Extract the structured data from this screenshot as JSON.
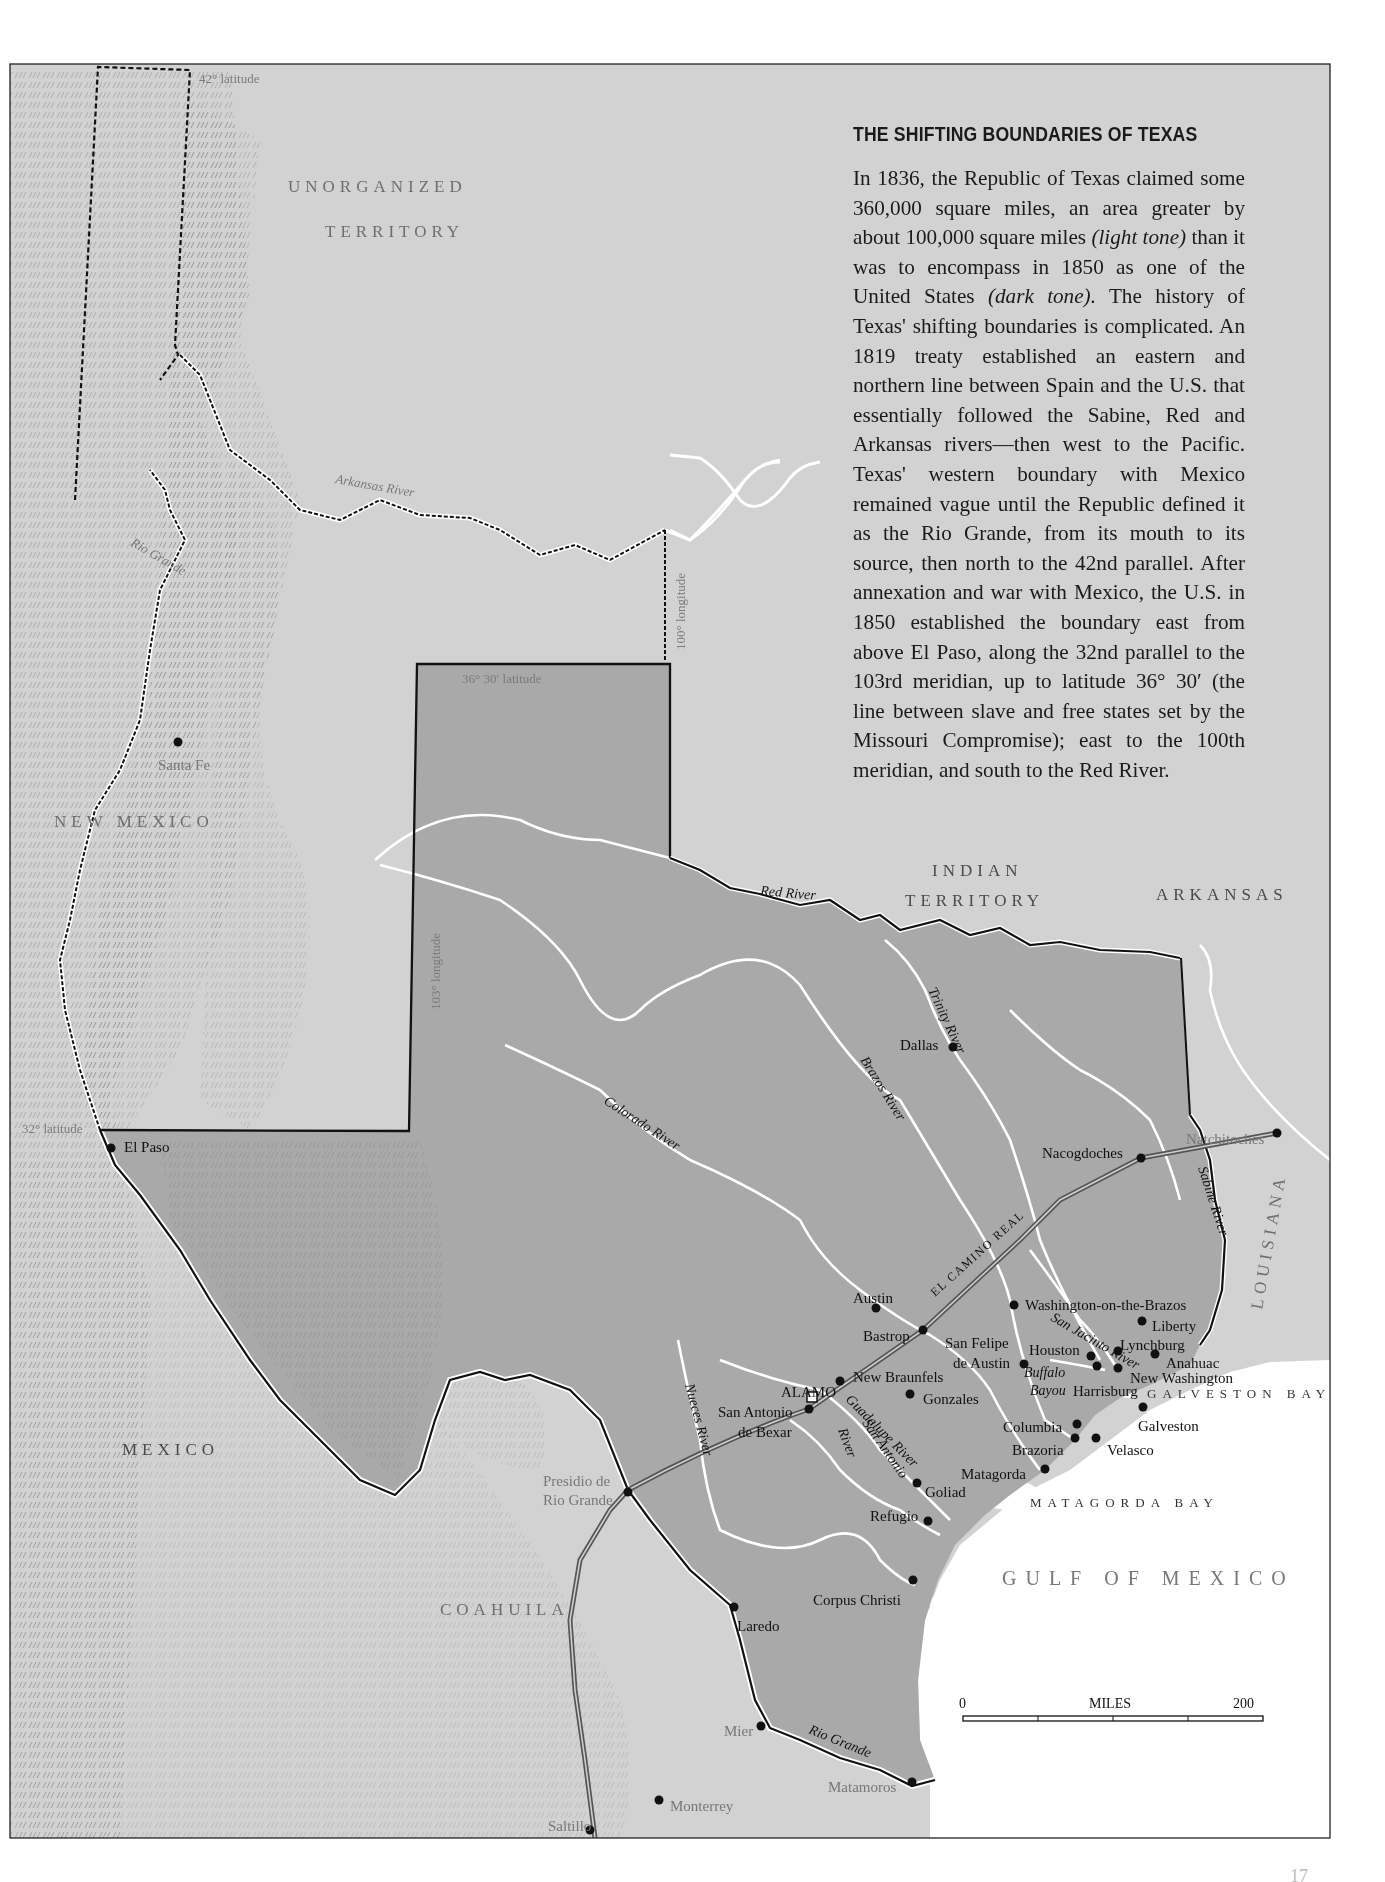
{
  "panel": {
    "title": "THE SHIFTING BOUNDARIES OF TEXAS",
    "body_segments": [
      {
        "text": "In 1836, the Republic of Texas claimed some 360,000 square miles, an area greater by about 100,000 square miles ",
        "italic": false
      },
      {
        "text": "(light tone)",
        "italic": true
      },
      {
        "text": " than it was to encompass in 1850 as one of the United States ",
        "italic": false
      },
      {
        "text": "(dark tone).",
        "italic": true
      },
      {
        "text": " The history of Texas' shifting boundaries is complicated. An 1819 treaty established an eastern and northern line between Spain and the U.S. that essentially followed the Sabine, Red and Arkansas rivers—then west to the Pacific. Texas' western boundary with Mexico remained vague until the Republic defined it as the Rio Grande, from its mouth to its source, then north to the 42nd parallel. After annexation and war with Mexico, the U.S. in 1850 established the boundary east from above El Paso, along the 32nd parallel to the 103rd meridian, up to latitude 36° 30′ (the line between slave and free states set by the Missouri Compromise); east to the 100th meridian, and south to the Red River.",
        "italic": false
      }
    ]
  },
  "colors": {
    "paper": "#ffffff",
    "light_tone": "#d2d2d2",
    "dark_tone": "#a9a9a9",
    "water": "#ffffff",
    "boundary": "#111111",
    "river": "#ffffff",
    "relief": "#6a6a6a"
  },
  "regions": [
    {
      "label": "UNORGANIZED",
      "x": 288,
      "y": 192,
      "style": "region-label"
    },
    {
      "label": "TERRITORY",
      "x": 325,
      "y": 237,
      "style": "region-label"
    },
    {
      "label": "NEW MEXICO",
      "x": 54,
      "y": 827,
      "style": "region-label"
    },
    {
      "label": "INDIAN",
      "x": 932,
      "y": 876,
      "style": "region-label-dark"
    },
    {
      "label": "TERRITORY",
      "x": 905,
      "y": 906,
      "style": "region-label-dark"
    },
    {
      "label": "ARKANSAS",
      "x": 1156,
      "y": 900,
      "style": "region-label-dark"
    },
    {
      "label": "MEXICO",
      "x": 122,
      "y": 1455,
      "style": "region-label-dark"
    },
    {
      "label": "COAHUILA",
      "x": 440,
      "y": 1615,
      "style": "region-label"
    }
  ],
  "louisiana": {
    "label": "LOUISIANA",
    "x": 1262,
    "y": 1310,
    "rotate": -80
  },
  "water_bodies": [
    {
      "label": "GALVESTON BAY",
      "x": 1147,
      "y": 1398,
      "style": "water-label"
    },
    {
      "label": "MATAGORDA BAY",
      "x": 1030,
      "y": 1507,
      "style": "water-label"
    },
    {
      "label": "GULF OF MEXICO",
      "x": 1002,
      "y": 1585,
      "style": "gulf-label"
    }
  ],
  "boundary_labels": [
    {
      "label": "42° latitude",
      "x": 199,
      "y": 83,
      "rotate": 0
    },
    {
      "label": "36° 30′ latitude",
      "x": 462,
      "y": 683,
      "rotate": 0
    },
    {
      "label": "32° latitude",
      "x": 22,
      "y": 1133,
      "rotate": 0
    },
    {
      "label": "100° longitude",
      "x": 685,
      "y": 650,
      "rotate": -90
    },
    {
      "label": "103° longitude",
      "x": 440,
      "y": 1010,
      "rotate": -90
    }
  ],
  "rivers": [
    {
      "label": "Arkansas River",
      "x": 335,
      "y": 483,
      "rotate": 10,
      "style": "river-label-light"
    },
    {
      "label": "Rio Grande",
      "x": 130,
      "y": 545,
      "rotate": 30,
      "style": "river-label-light"
    },
    {
      "label": "Red River",
      "x": 760,
      "y": 895,
      "rotate": 5,
      "style": "river-label"
    },
    {
      "label": "Trinity River",
      "x": 928,
      "y": 990,
      "rotate": 65,
      "style": "river-label"
    },
    {
      "label": "Brazos River",
      "x": 860,
      "y": 1060,
      "rotate": 58,
      "style": "river-label"
    },
    {
      "label": "Colorado River",
      "x": 603,
      "y": 1103,
      "rotate": 33,
      "style": "river-label"
    },
    {
      "label": "Sabine River",
      "x": 1198,
      "y": 1168,
      "rotate": 72,
      "style": "river-label"
    },
    {
      "label": "San Jacinto River",
      "x": 1050,
      "y": 1320,
      "rotate": 30,
      "style": "river-label"
    },
    {
      "label": "Buffalo",
      "x": 1024,
      "y": 1377,
      "rotate": 0,
      "style": "river-label"
    },
    {
      "label": "Bayou",
      "x": 1030,
      "y": 1395,
      "rotate": 0,
      "style": "river-label"
    },
    {
      "label": "Guadalupe River",
      "x": 845,
      "y": 1400,
      "rotate": 45,
      "style": "river-label"
    },
    {
      "label": "San Antonio",
      "x": 862,
      "y": 1423,
      "rotate": 55,
      "style": "river-label"
    },
    {
      "label": "River",
      "x": 838,
      "y": 1430,
      "rotate": 70,
      "style": "river-label"
    },
    {
      "label": "Nueces River",
      "x": 685,
      "y": 1385,
      "rotate": 75,
      "style": "river-label"
    },
    {
      "label": "Rio Grande",
      "x": 808,
      "y": 1733,
      "rotate": 22,
      "style": "river-label"
    }
  ],
  "places": [
    {
      "name": "Santa Fe",
      "dot_x": 178,
      "dot_y": 742,
      "label_x": 158,
      "label_y": 765,
      "style": "city-label-light"
    },
    {
      "name": "El Paso",
      "dot_x": 111,
      "dot_y": 1148,
      "label_x": 124,
      "label_y": 1147,
      "style": "city-label"
    },
    {
      "name": "Dallas",
      "dot_x": 953,
      "dot_y": 1047,
      "label_x": 900,
      "label_y": 1045,
      "style": "city-label"
    },
    {
      "name": "Nacogdoches",
      "dot_x": 1141,
      "dot_y": 1158,
      "label_x": 1042,
      "label_y": 1153,
      "style": "city-label"
    },
    {
      "name": "Natchitoches",
      "dot_x": 1277,
      "dot_y": 1133,
      "label_x": 1186,
      "label_y": 1139,
      "style": "city-label-light"
    },
    {
      "name": "Austin",
      "dot_x": 876,
      "dot_y": 1308,
      "label_x": 853,
      "label_y": 1298,
      "style": "city-label"
    },
    {
      "name": "Bastrop",
      "dot_x": 923,
      "dot_y": 1330,
      "label_x": 863,
      "label_y": 1336,
      "style": "city-label"
    },
    {
      "name": "Washington-on-the-Brazos",
      "dot_x": 1014,
      "dot_y": 1305,
      "label_x": 1025,
      "label_y": 1305,
      "style": "city-label"
    },
    {
      "name": "Liberty",
      "dot_x": 1142,
      "dot_y": 1321,
      "label_x": 1152,
      "label_y": 1326,
      "style": "city-label"
    },
    {
      "name": "San Felipe",
      "dot_x": null,
      "dot_y": null,
      "label_x": 945,
      "label_y": 1343,
      "style": "city-label"
    },
    {
      "name": "de Austin",
      "dot_x": 1024,
      "dot_y": 1364,
      "label_x": 953,
      "label_y": 1363,
      "style": "city-label"
    },
    {
      "name": "Houston",
      "dot_x": 1091,
      "dot_y": 1356,
      "label_x": 1029,
      "label_y": 1350,
      "style": "city-label"
    },
    {
      "name": "Lynchburg",
      "dot_x": 1118,
      "dot_y": 1351,
      "label_x": 1120,
      "label_y": 1345,
      "style": "city-label"
    },
    {
      "name": "Anahuac",
      "dot_x": 1155,
      "dot_y": 1354,
      "label_x": 1166,
      "label_y": 1363,
      "style": "city-label"
    },
    {
      "name": "New Washington",
      "dot_x": 1118,
      "dot_y": 1368,
      "label_x": 1130,
      "label_y": 1378,
      "style": "city-label"
    },
    {
      "name": "Harrisburg",
      "dot_x": 1097,
      "dot_y": 1366,
      "label_x": 1073,
      "label_y": 1391,
      "style": "city-label"
    },
    {
      "name": "Galveston",
      "dot_x": 1143,
      "dot_y": 1407,
      "label_x": 1138,
      "label_y": 1426,
      "style": "city-label"
    },
    {
      "name": "Columbia",
      "dot_x": 1077,
      "dot_y": 1424,
      "label_x": 1003,
      "label_y": 1427,
      "style": "city-label"
    },
    {
      "name": "Brazoria",
      "dot_x": 1075,
      "dot_y": 1438,
      "label_x": 1012,
      "label_y": 1450,
      "style": "city-label"
    },
    {
      "name": "Velasco",
      "dot_x": 1096,
      "dot_y": 1438,
      "label_x": 1107,
      "label_y": 1450,
      "style": "city-label"
    },
    {
      "name": "Matagorda",
      "dot_x": 1045,
      "dot_y": 1469,
      "label_x": 961,
      "label_y": 1474,
      "style": "city-label"
    },
    {
      "name": "New Braunfels",
      "dot_x": 840,
      "dot_y": 1381,
      "label_x": 853,
      "label_y": 1377,
      "style": "city-label"
    },
    {
      "name": "ALAMO",
      "dot_x": null,
      "dot_y": null,
      "label_x": 781,
      "label_y": 1392,
      "style": "city-label"
    },
    {
      "name": "San Antonio",
      "dot_x": 809,
      "dot_y": 1409,
      "label_x": 718,
      "label_y": 1412,
      "style": "city-label"
    },
    {
      "name": "de Bexar",
      "dot_x": null,
      "dot_y": null,
      "label_x": 738,
      "label_y": 1432,
      "style": "city-label"
    },
    {
      "name": "Gonzales",
      "dot_x": 910,
      "dot_y": 1394,
      "label_x": 923,
      "label_y": 1399,
      "style": "city-label"
    },
    {
      "name": "Goliad",
      "dot_x": 917,
      "dot_y": 1483,
      "label_x": 925,
      "label_y": 1492,
      "style": "city-label"
    },
    {
      "name": "Refugio",
      "dot_x": 928,
      "dot_y": 1521,
      "label_x": 870,
      "label_y": 1516,
      "style": "city-label"
    },
    {
      "name": "Corpus Christi",
      "dot_x": 913,
      "dot_y": 1580,
      "label_x": 813,
      "label_y": 1600,
      "style": "city-label"
    },
    {
      "name": "Presidio de",
      "dot_x": null,
      "dot_y": null,
      "label_x": 543,
      "label_y": 1481,
      "style": "city-label-light"
    },
    {
      "name": "Rio Grande",
      "dot_x": 628,
      "dot_y": 1492,
      "label_x": 543,
      "label_y": 1500,
      "style": "city-label-light"
    },
    {
      "name": "Laredo",
      "dot_x": 734,
      "dot_y": 1607,
      "label_x": 737,
      "label_y": 1626,
      "style": "city-label"
    },
    {
      "name": "Mier",
      "dot_x": 761,
      "dot_y": 1726,
      "label_x": 724,
      "label_y": 1731,
      "style": "city-label-light"
    },
    {
      "name": "Matamoros",
      "dot_x": 912,
      "dot_y": 1782,
      "label_x": 828,
      "label_y": 1787,
      "style": "city-label-light"
    },
    {
      "name": "Monterrey",
      "dot_x": 659,
      "dot_y": 1800,
      "label_x": 670,
      "label_y": 1806,
      "style": "city-label-light"
    },
    {
      "name": "Saltillo",
      "dot_x": 590,
      "dot_y": 1830,
      "label_x": 548,
      "label_y": 1826,
      "style": "city-label-light"
    }
  ],
  "road": {
    "label": "EL CAMINO REAL",
    "x": 935,
    "y": 1297,
    "rotate": -42
  },
  "alamo_marker": {
    "x": 812,
    "y": 1397
  },
  "scale_bar": {
    "start_label": "0",
    "unit_label": "MILES",
    "end_label": "200",
    "x0": 963,
    "x1": 1263,
    "y": 1718
  },
  "page_number": "17"
}
